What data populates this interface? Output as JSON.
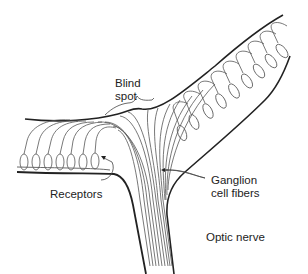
{
  "diagram": {
    "labels": {
      "blind_spot_line1": "Blind",
      "blind_spot_line2": "spot",
      "receptors": "Receptors",
      "ganglion_line1": "Ganglion",
      "ganglion_line2": "cell fibers",
      "optic_nerve": "Optic nerve"
    },
    "colors": {
      "line": "#222222",
      "fiber": "#555555",
      "background": "#ffffff"
    },
    "receptor_count_left": 7,
    "receptor_count_right": 10
  }
}
